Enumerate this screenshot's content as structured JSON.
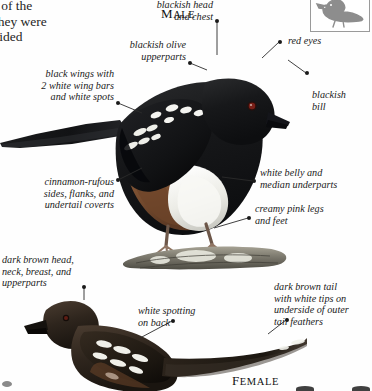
{
  "page": {
    "body_text": "t of the\nthey were\nsided",
    "background": "#fefefe"
  },
  "thumbnail": {
    "icon": "bird-silhouette-icon",
    "color": "#8d8d8d",
    "border": "#9a9a9a"
  },
  "captions": [
    {
      "id": "male",
      "text": "MALE",
      "first": "M",
      "rest": "ALE"
    },
    {
      "id": "female",
      "text": "FEMALE",
      "first": "F",
      "rest": "EMALE"
    }
  ],
  "labels": {
    "blackish_head": "blackish head\nand chest",
    "red_eyes": "red eyes",
    "blackish_bill": "blackish\nbill",
    "blackish_olive": "blackish olive\nupperparts",
    "black_wings": "black wings with\n2 white wing bars\nand white spots",
    "cinnamon_rufous": "cinnamon-rufous\nsides, flanks, and\nundertail coverts",
    "white_belly": "white belly and\nmedian underparts",
    "creamy_pink_legs": "creamy pink legs\nand feet",
    "dark_brown_head": "dark brown head,\nneck, breast, and\nupperparts",
    "white_spotting": "white spotting\non back",
    "dark_brown_tail": "dark brown tail\nwith white tips on\nunderside of outer\ntail feathers"
  },
  "colors": {
    "ink": "#1a1a1a",
    "leader": "#2b2b2b",
    "plumage_black": "#17181a",
    "plumage_dark_brown": "#3a3028",
    "rufous": "#8a5a38",
    "belly_white": "#f2f2ee",
    "bill": "#14151a",
    "eye_red": "#7a2018",
    "leg_pink": "#b79784",
    "branch": "#7d7a6e",
    "lichen": "#e8e8df"
  }
}
